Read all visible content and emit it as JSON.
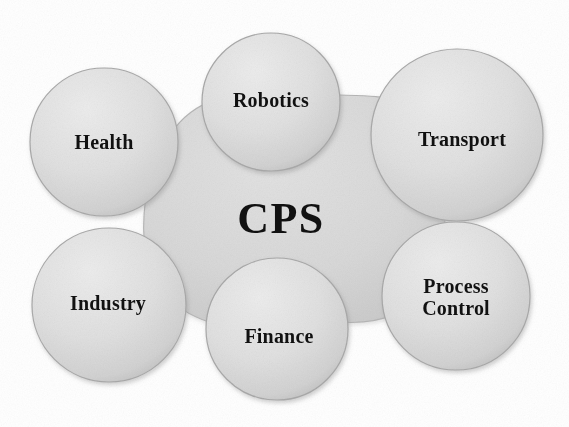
{
  "diagram": {
    "type": "hub-and-spoke-venn",
    "title": "CPS",
    "background_color": "#ffffff",
    "core": {
      "label": "CPS",
      "fill_color": "#d6d6d6",
      "stroke_color": "#b4b4b4",
      "text_color": "#111111",
      "center_x": 281,
      "center_y": 219
    },
    "nodes": [
      {
        "id": "health",
        "label": "Health",
        "center_x": 104,
        "center_y": 142,
        "radius": 74,
        "fill_color": "#dedede",
        "stroke_color": "#a9a9a9",
        "text_color": "#111111"
      },
      {
        "id": "robotics",
        "label": "Robotics",
        "center_x": 271,
        "center_y": 102,
        "radius": 69,
        "fill_color": "#dedede",
        "stroke_color": "#a9a9a9",
        "text_color": "#111111"
      },
      {
        "id": "transport",
        "label": "Transport",
        "center_x": 457,
        "center_y": 135,
        "radius": 86,
        "fill_color": "#dedede",
        "stroke_color": "#a9a9a9",
        "text_color": "#111111"
      },
      {
        "id": "industry",
        "label": "Industry",
        "center_x": 109,
        "center_y": 305,
        "radius": 77,
        "fill_color": "#dedede",
        "stroke_color": "#a9a9a9",
        "text_color": "#111111"
      },
      {
        "id": "finance",
        "label": "Finance",
        "center_x": 277,
        "center_y": 329,
        "radius": 71,
        "fill_color": "#dedede",
        "stroke_color": "#a9a9a9",
        "text_color": "#111111"
      },
      {
        "id": "process-control",
        "label": "Process\nControl",
        "center_x": 456,
        "center_y": 296,
        "radius": 74,
        "fill_color": "#dedede",
        "stroke_color": "#a9a9a9",
        "text_color": "#111111"
      }
    ]
  }
}
